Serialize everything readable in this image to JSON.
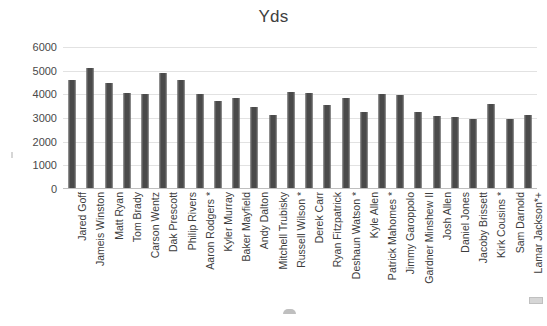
{
  "chart_data": {
    "type": "bar",
    "title": "Yds",
    "xlabel": "",
    "ylabel": "",
    "ylim": [
      0,
      6000
    ],
    "yticks": [
      0,
      1000,
      2000,
      3000,
      4000,
      5000,
      6000
    ],
    "ytick_labels": [
      "0",
      "1000",
      "2000",
      "3000",
      "4000",
      "5000",
      "6000"
    ],
    "grid": true,
    "legend": false,
    "legend_position": "none",
    "orientation": "vertical",
    "bar_color": "#4a4a4a",
    "categories": [
      "Jared Goff",
      "Jameis Winston",
      "Matt Ryan",
      "Tom Brady",
      "Carson Wentz",
      "Dak Prescott",
      "Philip Rivers",
      "Aaron Rodgers *",
      "Kyler Murray",
      "Baker Mayfield",
      "Andy Dalton",
      "Mitchell Trubisky",
      "Russell Wilson *",
      "Derek Carr",
      "Ryan Fitzpatrick",
      "Deshaun Watson *",
      "Kyle Allen",
      "Patrick Mahomes *",
      "Jimmy Garoppolo",
      "Gardner Minshew II",
      "Josh Allen",
      "Daniel Jones",
      "Jacoby Brissett",
      "Kirk Cousins *",
      "Sam Darnold",
      "Lamar Jackson*+"
    ],
    "values": [
      4620,
      5110,
      4460,
      4060,
      4000,
      4900,
      4620,
      4000,
      3720,
      3830,
      3480,
      3140,
      4110,
      4050,
      3530,
      3850,
      3270,
      4030,
      3980,
      3270,
      3090,
      3030,
      2940,
      3600,
      2970,
      3130
    ]
  }
}
